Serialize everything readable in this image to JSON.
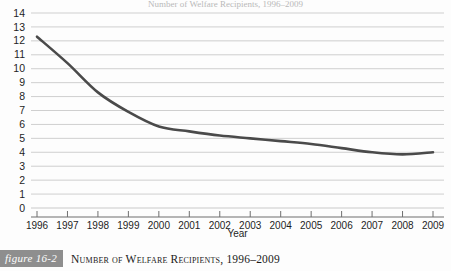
{
  "figure": {
    "badge_label": "figure 16-2",
    "caption": "Number of Welfare Recipients, 1996–2009",
    "cutoff_title": "Number of Welfare Recipients, 1996–2009"
  },
  "colors": {
    "line": "#4a4a4a",
    "grid": "#c9c9c9",
    "axis": "#6f6f6f",
    "badge_bg": "#8e8e8e",
    "text": "#1a1a1a",
    "background": "#fdfdfd"
  },
  "chart_data": {
    "type": "line",
    "title": "",
    "xlabel": "Year",
    "ylabel": "",
    "categories": [
      "1996",
      "1997",
      "1998",
      "1999",
      "2000",
      "2001",
      "2002",
      "2003",
      "2004",
      "2005",
      "2006",
      "2007",
      "2008",
      "2009"
    ],
    "values": [
      12.3,
      10.4,
      8.3,
      6.9,
      5.85,
      5.5,
      5.2,
      5.0,
      4.8,
      4.6,
      4.3,
      4.0,
      3.85,
      4.0
    ],
    "series": [
      {
        "name": "Number of welfare recipients",
        "values": [
          12.3,
          10.4,
          8.3,
          6.9,
          5.85,
          5.5,
          5.2,
          5.0,
          4.8,
          4.6,
          4.3,
          4.0,
          3.85,
          4.0
        ]
      }
    ],
    "ylim": [
      0,
      14
    ],
    "ytick_step": 1,
    "yticks": [
      "0",
      "1",
      "2",
      "3",
      "4",
      "5",
      "6",
      "7",
      "8",
      "9",
      "10",
      "11",
      "12",
      "13",
      "14"
    ],
    "grid": true,
    "grid_axis": "y",
    "legend": false,
    "legend_position": "none",
    "markers": false,
    "smooth": true
  }
}
